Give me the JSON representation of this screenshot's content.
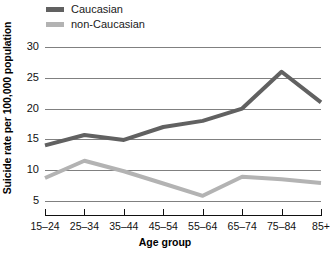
{
  "chart_data": {
    "type": "line",
    "title": "",
    "xlabel": "Age group",
    "ylabel": "Suicide rate per 100,000 population",
    "categories": [
      "15–24",
      "25–34",
      "35–44",
      "45–54",
      "55–64",
      "65–74",
      "75–84",
      "85+"
    ],
    "ylim": [
      3,
      31
    ],
    "yticks": [
      5,
      10,
      15,
      20,
      25,
      30
    ],
    "ytick_labels": [
      "5",
      "10",
      "15",
      "20",
      "25",
      "30"
    ],
    "grid": "horizontal",
    "legend_position": "top-left",
    "series": [
      {
        "name": "Caucasian",
        "color": "#616161",
        "values": [
          14.0,
          15.7,
          14.9,
          17.0,
          18.0,
          20.0,
          26.0,
          21.0
        ]
      },
      {
        "name": "non-Caucasian",
        "color": "#b3b3b3",
        "values": [
          8.7,
          11.5,
          9.8,
          7.8,
          5.8,
          8.9,
          8.5,
          7.9
        ]
      }
    ]
  },
  "legend": {
    "items": [
      {
        "label": "Caucasian",
        "color": "#616161"
      },
      {
        "label": "non-Caucasian",
        "color": "#b3b3b3"
      }
    ]
  },
  "axes": {
    "y_title": "Suicide rate per 100,000 population",
    "x_title": "Age group"
  },
  "colors": {
    "caucasian": "#616161",
    "non_caucasian": "#b3b3b3",
    "gridline": "#808080",
    "axis": "#111111",
    "background": "#ffffff"
  }
}
